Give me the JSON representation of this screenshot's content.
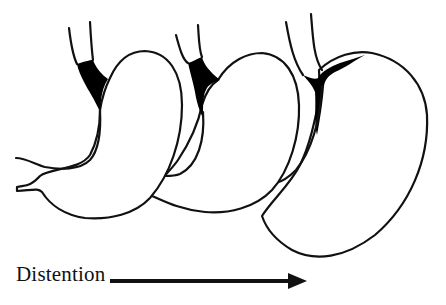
{
  "figure": {
    "stages": [
      {
        "label": "Stage 1 (undistended stomach)"
      },
      {
        "label": "Stage 2 (partially distended stomach)"
      },
      {
        "label": "Stage 3 (fully distended stomach)"
      }
    ],
    "arrow": {
      "label": "Distention",
      "direction": "right"
    },
    "colors": {
      "line": "#111111",
      "fill_highlight": "#000000",
      "background": "#ffffff"
    }
  }
}
